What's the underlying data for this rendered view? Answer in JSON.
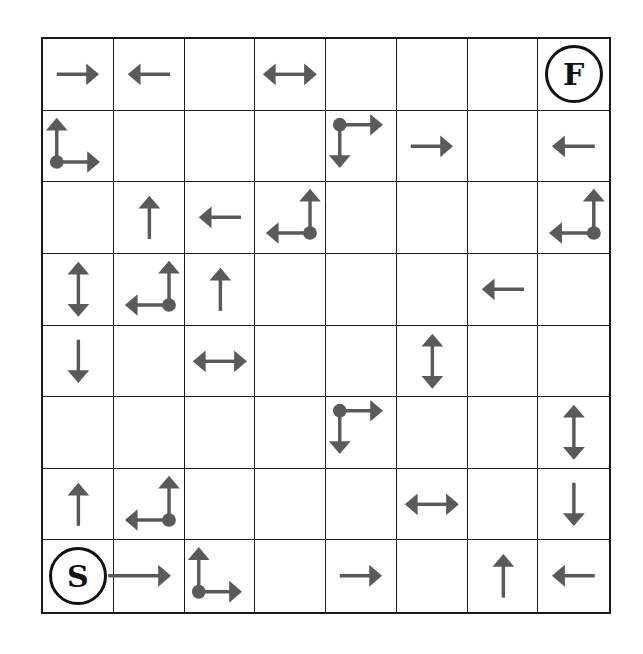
{
  "puzzle": {
    "rows": 8,
    "cols": 8,
    "arrow_color": "#5a5a5a",
    "grid_color": "#1a1a1a",
    "start": {
      "label": "S",
      "row": 7,
      "col": 0
    },
    "finish": {
      "label": "F",
      "row": 0,
      "col": 7
    },
    "grid": [
      [
        "r",
        "l",
        "",
        "lr",
        "",
        "",
        "",
        "F"
      ],
      [
        "ur",
        "",
        "",
        "",
        "rd",
        "r",
        "",
        "l"
      ],
      [
        "",
        "u",
        "l",
        "ul",
        "",
        "",
        "",
        "ul"
      ],
      [
        "ud",
        "ul",
        "u",
        "",
        "",
        "",
        "l",
        ""
      ],
      [
        "d",
        "",
        "lr",
        "",
        "",
        "ud",
        "",
        ""
      ],
      [
        "",
        "",
        "",
        "",
        "rd",
        "",
        "",
        "ud"
      ],
      [
        "u",
        "ul",
        "",
        "",
        "",
        "lr",
        "",
        "d"
      ],
      [
        "S",
        "rlong",
        "ur",
        "",
        "r",
        "",
        "u",
        "l"
      ]
    ]
  }
}
